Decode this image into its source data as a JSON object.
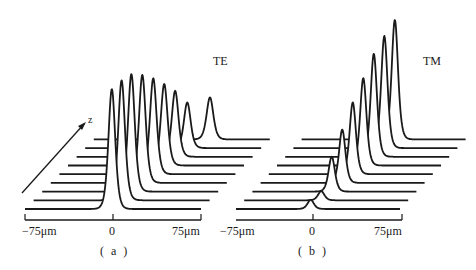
{
  "chart_data": [
    {
      "type": "line",
      "subtype": "waterfall-3d",
      "panel": "(a)",
      "title": "TE",
      "xlabel": "",
      "zlabel": "z",
      "x_ticks": [
        "-75μm",
        "0",
        "75μm"
      ],
      "x_range_um": [
        -75,
        75
      ],
      "n_traces": 9,
      "series": [
        {
          "name": "z0",
          "peak_x_um": -1,
          "peak_height": 1.0
        },
        {
          "name": "z1",
          "peak_x_um": 0,
          "peak_height": 1.0
        },
        {
          "name": "z2",
          "peak_x_um": 1,
          "peak_height": 0.98
        },
        {
          "name": "z3",
          "peak_x_um": 3,
          "peak_height": 0.9
        },
        {
          "name": "z4",
          "peak_x_um": 5,
          "peak_height": 0.8
        },
        {
          "name": "z5",
          "peak_x_um": 7,
          "peak_height": 0.68
        },
        {
          "name": "z6",
          "peak_x_um": 9,
          "peak_height": 0.55
        },
        {
          "name": "z7",
          "peak_x_um": 12,
          "peak_height": 0.38
        },
        {
          "name": "z8",
          "peak_x_um": 24,
          "peak_height": 0.35
        }
      ],
      "grid": false,
      "legend": "none"
    },
    {
      "type": "line",
      "subtype": "waterfall-3d",
      "panel": "(b)",
      "title": "TM",
      "xlabel": "",
      "zlabel": "",
      "x_ticks": [
        "-75μm",
        "0",
        "75μm"
      ],
      "x_range_um": [
        -75,
        75
      ],
      "n_traces": 9,
      "series": [
        {
          "name": "z0",
          "peak_x_um": -2,
          "peak_height": 0.1
        },
        {
          "name": "z1",
          "peak_x_um": 0,
          "peak_height": 0.1
        },
        {
          "name": "z2",
          "peak_x_um": 2,
          "peak_height": 0.38
        },
        {
          "name": "z3",
          "peak_x_um": 4,
          "peak_height": 0.58
        },
        {
          "name": "z4",
          "peak_x_um": 6,
          "peak_height": 0.78
        },
        {
          "name": "z5",
          "peak_x_um": 8,
          "peak_height": 0.95
        },
        {
          "name": "z6",
          "peak_x_um": 10,
          "peak_height": 1.12
        },
        {
          "name": "z7",
          "peak_x_um": 12,
          "peak_height": 1.22
        },
        {
          "name": "z8",
          "peak_x_um": 14,
          "peak_height": 1.3
        }
      ],
      "grid": false,
      "legend": "none"
    }
  ],
  "labels": {
    "te": "TE",
    "tm": "TM",
    "z_axis": "z",
    "panel_a": "( a )",
    "panel_b": "( b )",
    "a_tick_left": "−75μm",
    "a_tick_mid": "0",
    "a_tick_right": "75μm",
    "b_tick_left": "−75μm",
    "b_tick_mid": "0",
    "b_tick_right": "75μm"
  },
  "colors": {
    "ink": "#1a1a1a",
    "background": "#ffffff"
  }
}
